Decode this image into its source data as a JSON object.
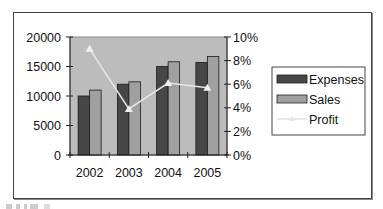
{
  "chart_data": {
    "type": "bar",
    "combo": "bar+line (secondary axis)",
    "title": "",
    "categories": [
      "2002",
      "2003",
      "2004",
      "2005"
    ],
    "series": [
      {
        "name": "Expenses",
        "type": "bar",
        "axis": "left",
        "color": "#474747",
        "values": [
          10000,
          12000,
          15000,
          15700
        ]
      },
      {
        "name": "Sales",
        "type": "bar",
        "axis": "left",
        "color": "#a0a0a0",
        "values": [
          11000,
          12400,
          15800,
          16700
        ]
      },
      {
        "name": "Profit",
        "type": "line",
        "axis": "right",
        "color": "#e8e8e8",
        "marker": "triangle",
        "values": [
          9.0,
          3.9,
          6.1,
          5.7
        ],
        "unit": "%"
      }
    ],
    "left_axis": {
      "ticks": [
        "0",
        "5000",
        "10000",
        "15000",
        "20000"
      ],
      "ylim": [
        0,
        20000
      ]
    },
    "right_axis": {
      "ticks": [
        "0%",
        "2%",
        "4%",
        "6%",
        "8%",
        "10%"
      ],
      "ylim": [
        0,
        10
      ]
    },
    "xlabel": "",
    "ylabel": "",
    "grid": false,
    "legend_position": "right",
    "plot_background": "#bcbcbc"
  },
  "legend": {
    "items": [
      {
        "label": "Expenses"
      },
      {
        "label": "Sales"
      },
      {
        "label": "Profit"
      }
    ]
  }
}
